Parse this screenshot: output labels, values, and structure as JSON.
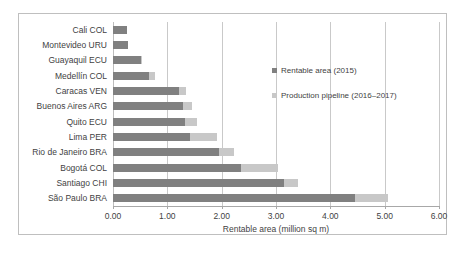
{
  "chart_data": {
    "type": "bar",
    "orientation": "horizontal",
    "stacked": true,
    "title": "",
    "xlabel": "Rentable area (million sq m)",
    "ylabel": "",
    "xlim": [
      0,
      6
    ],
    "xticks": [
      "0.00",
      "1.00",
      "2.00",
      "3.00",
      "4.00",
      "5.00",
      "6.00"
    ],
    "xtick_values": [
      0,
      1,
      2,
      3,
      4,
      5,
      6
    ],
    "grid": "vertical",
    "legend_position": "upper-right",
    "categories": [
      "Cali COL",
      "Montevideo URU",
      "Guayaquil ECU",
      "Medellín COL",
      "Caracas VEN",
      "Buenos Aires ARG",
      "Quito ECU",
      "Lima PER",
      "Rio de Janeiro BRA",
      "Bogotá COL",
      "Santiago CHI",
      "São Paulo BRA"
    ],
    "series": [
      {
        "name": "Rentable area (2015)",
        "color": "#808080",
        "values": [
          0.26,
          0.27,
          0.52,
          0.66,
          1.22,
          1.28,
          1.33,
          1.42,
          1.95,
          2.35,
          3.15,
          4.45
        ]
      },
      {
        "name": "Production pipeline (2016–2017)",
        "color": "#c8c8c8",
        "values": [
          0.0,
          0.0,
          0.02,
          0.12,
          0.13,
          0.17,
          0.22,
          0.5,
          0.27,
          0.68,
          0.25,
          0.62
        ]
      }
    ],
    "totals": [
      0.26,
      0.27,
      0.54,
      0.78,
      1.35,
      1.45,
      1.55,
      1.92,
      2.22,
      3.03,
      3.4,
      5.07
    ]
  },
  "legend": {
    "entries": [
      {
        "label": "Rentable area (2015)"
      },
      {
        "label": "Production pipeline (2016–2017)"
      }
    ]
  },
  "colors": {
    "series_rentable": "#808080",
    "series_pipeline": "#c8c8c8",
    "gridline": "#c9c9c9",
    "frame": "#bfbfbf",
    "text": "#3f3f3f"
  }
}
